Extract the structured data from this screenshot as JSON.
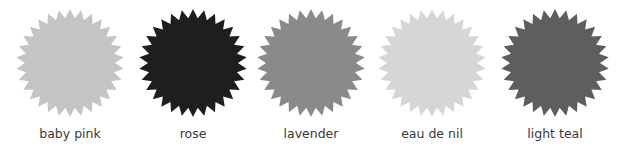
{
  "swatches": [
    {
      "label": "baby pink",
      "color": "#c4c4c4",
      "center_x": 70
    },
    {
      "label": "rose",
      "color": "#1e1e1e",
      "center_x": 193
    },
    {
      "label": "lavender",
      "color": "#8a8a8a",
      "center_x": 311
    },
    {
      "label": "eau de nil",
      "color": "#d6d6d6",
      "center_x": 432
    },
    {
      "label": "light teal",
      "color": "#5e5e5e",
      "center_x": 555
    }
  ],
  "star": {
    "points": 30,
    "outer_radius": 54,
    "inner_radius": 45
  }
}
